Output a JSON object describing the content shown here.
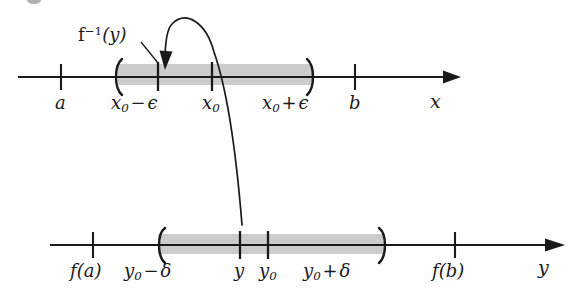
{
  "figure": {
    "title_fragment": "",
    "background_color": "#fefefe",
    "ink_color": "#1a1a1a",
    "band_color": "#cccccc"
  },
  "top_axis": {
    "name": "x",
    "interval_label_left": "a",
    "interval_label_right": "b",
    "ticks": [
      {
        "id": "a",
        "base": "a",
        "sub": "",
        "x": 61
      },
      {
        "id": "x0-minus-eps",
        "base": "x",
        "sub": "0",
        "op": "−",
        "tail": "ϵ",
        "x": 158
      },
      {
        "id": "x0",
        "base": "x",
        "sub": "0",
        "x": 212
      },
      {
        "id": "x0-plus-eps",
        "base": "x",
        "sub": "0",
        "op": "+",
        "tail": "ϵ",
        "x": 300
      },
      {
        "id": "b",
        "base": "b",
        "sub": "",
        "x": 355
      }
    ],
    "labels": {
      "a": "a",
      "x0_minus_eps": "x₀ − ϵ",
      "x0": "x₀",
      "x0_plus_eps": "x₀ + ϵ",
      "b": "b",
      "axis": "x"
    },
    "band": {
      "start": 118,
      "end": 312
    }
  },
  "bottom_axis": {
    "name": "y",
    "ticks": [
      {
        "id": "f-of-a",
        "x": 93
      },
      {
        "id": "y0-minus-delta",
        "x": 170
      },
      {
        "id": "y",
        "x": 240
      },
      {
        "id": "y0",
        "x": 268
      },
      {
        "id": "y0-plus-delta",
        "x": 330
      },
      {
        "id": "f-of-b",
        "x": 455
      }
    ],
    "labels": {
      "f_of_a": "f(a)",
      "y0_minus_delta": "y₀ − δ",
      "y": "y",
      "y0": "y₀",
      "y0_plus_delta": "y₀ + δ",
      "f_of_b": "f(b)",
      "axis": "y"
    },
    "band": {
      "start": 158,
      "end": 385
    }
  },
  "callout": {
    "label": "f⁻¹(y)",
    "label_base": "f",
    "label_exponent": "−1",
    "label_argument": "(y)",
    "points_to_tick": "x0-minus-eps"
  },
  "mapping_arrow": {
    "from_label": "y",
    "to_label": "f⁻¹(y)",
    "description": "curve from y on the y-axis up to the preimage point on the x-axis"
  }
}
